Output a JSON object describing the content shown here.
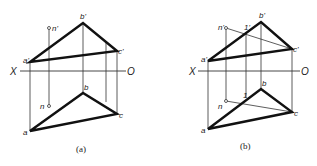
{
  "figure": {
    "axis": {
      "left_label": "X",
      "right_label": "O"
    },
    "panels": [
      {
        "id": "a",
        "caption": "(a)",
        "front_view": {
          "vertices": {
            "a_prime": "a'",
            "b_prime": "b'",
            "c_prime": "c'"
          },
          "point": "n'"
        },
        "top_view": {
          "vertices": {
            "a": "a",
            "b": "b",
            "c": "c"
          },
          "point": "n"
        }
      },
      {
        "id": "b",
        "caption": "(b)",
        "front_view": {
          "vertices": {
            "a_prime": "a'",
            "b_prime": "b'",
            "c_prime": "c'"
          },
          "point": "n'",
          "aux_point": "1'"
        },
        "top_view": {
          "vertices": {
            "a": "a",
            "b": "b",
            "c": "c"
          },
          "point": "n",
          "aux_point": "1"
        }
      }
    ],
    "colors": {
      "line": "#111111",
      "background": "#ffffff"
    }
  }
}
